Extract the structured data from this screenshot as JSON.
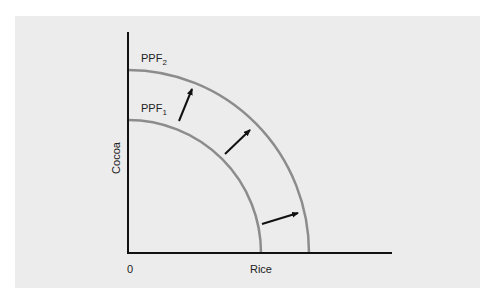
{
  "diagram": {
    "title": "",
    "y_axis_label": "Cocoa",
    "x_axis_label": "Rice",
    "origin_label": "0",
    "curves": [
      {
        "name": "PPF",
        "subscript": "1",
        "role": "original frontier"
      },
      {
        "name": "PPF",
        "subscript": "2",
        "role": "shifted frontier"
      }
    ],
    "arrows": 3,
    "colors": {
      "background": "#ececec",
      "axis": "#111111",
      "curve": "#8c8c8c",
      "arrow": "#111111"
    }
  }
}
